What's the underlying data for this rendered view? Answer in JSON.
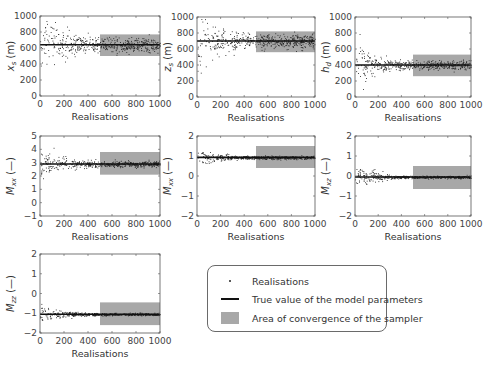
{
  "chart_data": [
    {
      "type": "scatter",
      "panel": "xs",
      "ylabel": "x_s (m)",
      "ylabel_main": "x",
      "ylabel_sub": "s",
      "ylabel_unit": "(m)",
      "xlabel": "Realisations",
      "xlim": [
        0,
        1000
      ],
      "ylim": [
        0,
        1000
      ],
      "xticks": [
        0,
        200,
        400,
        600,
        800,
        1000
      ],
      "yticks": [
        0,
        200,
        400,
        600,
        800,
        1000
      ],
      "true_value": 640,
      "convergence_area": {
        "x": [
          500,
          1000
        ],
        "y": [
          500,
          770
        ]
      },
      "spread_initial": 300,
      "spread_final": 80
    },
    {
      "type": "scatter",
      "panel": "zs",
      "ylabel": "z_s (m)",
      "ylabel_main": "z",
      "ylabel_sub": "s",
      "ylabel_unit": "(m)",
      "xlabel": "Realisations",
      "xlim": [
        0,
        1000
      ],
      "ylim": [
        0,
        1000
      ],
      "xticks": [
        0,
        200,
        400,
        600,
        800,
        1000
      ],
      "yticks": [
        0,
        200,
        400,
        600,
        800,
        1000
      ],
      "true_value": 700,
      "convergence_area": {
        "x": [
          500,
          1000
        ],
        "y": [
          560,
          820
        ]
      },
      "spread_initial": 300,
      "spread_final": 80
    },
    {
      "type": "scatter",
      "panel": "hd",
      "ylabel": "h_d (m)",
      "ylabel_main": "h",
      "ylabel_sub": "d",
      "ylabel_unit": "(m)",
      "xlabel": "Realisations",
      "xlim": [
        0,
        1000
      ],
      "ylim": [
        0,
        1000
      ],
      "xticks": [
        0,
        200,
        400,
        600,
        800,
        1000
      ],
      "yticks": [
        0,
        200,
        400,
        600,
        800,
        1000
      ],
      "true_value": 400,
      "convergence_area": {
        "x": [
          500,
          1000
        ],
        "y": [
          260,
          530
        ]
      },
      "spread_initial": 200,
      "spread_final": 50
    },
    {
      "type": "scatter",
      "panel": "Mxx",
      "ylabel": "M_xx (—)",
      "ylabel_main": "M",
      "ylabel_sub": "xx",
      "ylabel_unit": "(—)",
      "xlabel": "Realisations",
      "xlim": [
        0,
        1000
      ],
      "ylim": [
        -1,
        5
      ],
      "xticks": [
        0,
        200,
        400,
        600,
        800,
        1000
      ],
      "yticks": [
        -1,
        0,
        1,
        2,
        3,
        4,
        5
      ],
      "true_value": 2.9,
      "convergence_area": {
        "x": [
          500,
          1000
        ],
        "y": [
          2.1,
          3.8
        ]
      },
      "spread_initial": 0.8,
      "spread_final": 0.2
    },
    {
      "type": "scatter",
      "panel": "Mxx2",
      "ylabel": "M_xx (—)",
      "ylabel_main": "M",
      "ylabel_sub": "xx",
      "ylabel_unit": "(—)",
      "xlabel": "Realisations",
      "xlim": [
        0,
        1000
      ],
      "ylim": [
        -2,
        2
      ],
      "xticks": [
        0,
        200,
        400,
        600,
        800,
        1000
      ],
      "yticks": [
        -2,
        -1,
        0,
        1,
        2
      ],
      "true_value": 0.93,
      "convergence_area": {
        "x": [
          500,
          1000
        ],
        "y": [
          0.4,
          1.5
        ]
      },
      "spread_initial": 0.3,
      "spread_final": 0.07
    },
    {
      "type": "scatter",
      "panel": "Mxz",
      "ylabel": "M_xz (—)",
      "ylabel_main": "M",
      "ylabel_sub": "xz",
      "ylabel_unit": "(—)",
      "xlabel": "Realisations",
      "xlim": [
        0,
        1000
      ],
      "ylim": [
        -2,
        2
      ],
      "xticks": [
        0,
        200,
        400,
        600,
        800,
        1000
      ],
      "yticks": [
        -2,
        -1,
        0,
        1,
        2
      ],
      "true_value": -0.05,
      "convergence_area": {
        "x": [
          500,
          1000
        ],
        "y": [
          -0.65,
          0.5
        ]
      },
      "spread_initial": 0.4,
      "spread_final": 0.06
    },
    {
      "type": "scatter",
      "panel": "Mzz",
      "ylabel": "M_zz (—)",
      "ylabel_main": "M",
      "ylabel_sub": "zz",
      "ylabel_unit": "(—)",
      "xlabel": "Realisations",
      "xlim": [
        0,
        1000
      ],
      "ylim": [
        -2,
        2
      ],
      "xticks": [
        0,
        200,
        400,
        600,
        800,
        1000
      ],
      "yticks": [
        -2,
        -1,
        0,
        1,
        2
      ],
      "true_value": -1.05,
      "convergence_area": {
        "x": [
          500,
          1000
        ],
        "y": [
          -1.6,
          -0.45
        ]
      },
      "spread_initial": 0.35,
      "spread_final": 0.06
    }
  ],
  "layout": {
    "panels": [
      {
        "x": 40,
        "y": 16,
        "w": 120,
        "h": 80
      },
      {
        "x": 197,
        "y": 17,
        "w": 118,
        "h": 80
      },
      {
        "x": 355,
        "y": 17,
        "w": 116,
        "h": 80
      },
      {
        "x": 40,
        "y": 136,
        "w": 120,
        "h": 80
      },
      {
        "x": 197,
        "y": 136,
        "w": 118,
        "h": 80
      },
      {
        "x": 355,
        "y": 136,
        "w": 116,
        "h": 80
      },
      {
        "x": 40,
        "y": 254,
        "w": 120,
        "h": 79
      }
    ]
  },
  "colors": {
    "frame": "#555555",
    "tick_text": "#444444",
    "points": "#222222",
    "true_line": "#111111",
    "convergence_area": "#a8a8a8"
  },
  "legend": {
    "items": [
      {
        "symbol": "dot",
        "label": "Realisations"
      },
      {
        "symbol": "line",
        "label": "True value of the model parameters"
      },
      {
        "symbol": "rect",
        "label": "Area of convergence of the sampler"
      }
    ]
  }
}
